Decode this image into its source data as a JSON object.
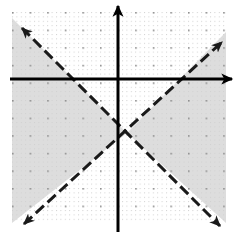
{
  "figure": {
    "kind": "coordinate-plane-inequality-graph",
    "width": 237,
    "height": 233,
    "background": "#ffffff"
  },
  "grid": {
    "name": "dotted-coordinate-grid",
    "left": 12,
    "top": 12,
    "right": 226,
    "bottom": 223,
    "major_spacing": 17.6,
    "minor_spacing": 4.4,
    "major_dot_color": "#9a9a9a",
    "minor_dot_color": "#c9c9c9",
    "visible": true
  },
  "axes": {
    "color": "#000000",
    "stroke_width": 3,
    "origin": {
      "x": 118,
      "y": 79
    },
    "x_axis": {
      "name": "x-axis",
      "x1": 10,
      "y1": 79,
      "x2": 234,
      "y2": 79,
      "arrow_right": true,
      "arrow_left": false
    },
    "y_axis": {
      "name": "y-axis",
      "x1": 118,
      "y1": 232,
      "x2": 118,
      "y2": 3,
      "arrow_up": true,
      "arrow_down": false
    }
  },
  "boundary_lines": [
    {
      "name": "dashed-line-negative-slope",
      "style": "dashed",
      "slope": -1,
      "color": "#1a1a1a",
      "stroke_width": 3,
      "dash_pattern": "11 5",
      "x1": 22,
      "y1": 28,
      "x2": 220,
      "y2": 226,
      "arrow_start": true,
      "arrow_end": true
    },
    {
      "name": "dashed-line-positive-slope",
      "style": "dashed",
      "slope": 1,
      "color": "#1a1a1a",
      "stroke_width": 3,
      "dash_pattern": "11 5",
      "x1": 24,
      "y1": 224,
      "x2": 222,
      "y2": 42,
      "arrow_start": true,
      "arrow_end": true
    }
  ],
  "intersection": {
    "name": "lines-intersection-point",
    "x": 127,
    "y": 133
  },
  "shading": {
    "name": "solution-region",
    "fill": "#d7d7d7",
    "opacity": 0.85,
    "description": "left and right wedges of the X are shaded",
    "regions": [
      {
        "name": "left-shaded-wedge",
        "points": "12,18 127,133 12,223"
      },
      {
        "name": "right-shaded-wedge",
        "points": "226,32 127,133 226,223"
      }
    ]
  }
}
